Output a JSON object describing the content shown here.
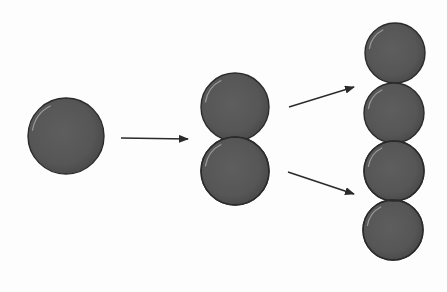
{
  "diagram": {
    "colors": {
      "background": "#fdfdfd",
      "cell_fill": "#5a5a5a",
      "cell_stroke": "#2b2b2b",
      "arrow": "#2a2a2a"
    },
    "stages": [
      {
        "label": "",
        "cells": [
          {
            "cx": 66,
            "cy": 136,
            "r": 38
          }
        ]
      },
      {
        "label": "",
        "cells": [
          {
            "cx": 235,
            "cy": 107,
            "r": 34
          },
          {
            "cx": 235,
            "cy": 171,
            "r": 34
          }
        ]
      },
      {
        "label": "",
        "cells": [
          {
            "cx": 395,
            "cy": 53,
            "r": 30
          },
          {
            "cx": 394,
            "cy": 113,
            "r": 30
          },
          {
            "cx": 394,
            "cy": 171,
            "r": 30
          },
          {
            "cx": 393,
            "cy": 230,
            "r": 30
          }
        ]
      }
    ],
    "arrows": [
      {
        "x1": 121,
        "y1": 138,
        "x2": 188,
        "y2": 139
      },
      {
        "x1": 289,
        "y1": 107,
        "x2": 354,
        "y2": 87
      },
      {
        "x1": 288,
        "y1": 172,
        "x2": 354,
        "y2": 194
      }
    ]
  }
}
